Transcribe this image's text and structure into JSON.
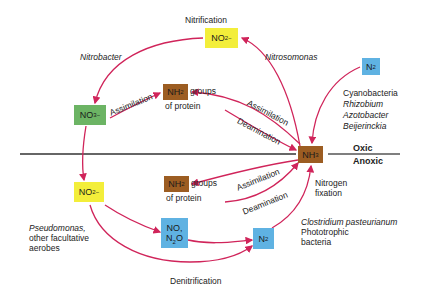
{
  "zones": {
    "oxic": "Oxic",
    "anoxic": "Anoxic"
  },
  "processes": {
    "nitrification": "Nitrification",
    "denitrification": "Denitrification",
    "nitrogen_fixation": [
      "Nitrogen",
      "fixation"
    ],
    "assimilation_upper_left": "Assimilation",
    "assimilation_upper_right": "Assimilation",
    "deamination_upper": "Deamination",
    "assimilation_lower": "Assimilation",
    "deamination_lower": "Deamination"
  },
  "compounds": {
    "no2_top": {
      "base": "NO",
      "sub": "2",
      "sup": "−",
      "color": "#f3ee3a"
    },
    "no3": {
      "base": "NO",
      "sub": "3",
      "sup": "−",
      "color": "#6cb464"
    },
    "nh2_upper": {
      "base": "NH",
      "sub": "2",
      "color": "#9c5d22",
      "suffix": "groups",
      "line2": "of protein"
    },
    "nh3": {
      "base": "NH",
      "sub": "3",
      "color": "#9c5d22"
    },
    "n2_top": {
      "base": "N",
      "sub": "2",
      "color": "#5fb2e2"
    },
    "no2_bottom": {
      "base": "NO",
      "sub": "2",
      "sup": "−",
      "color": "#f3ee3a"
    },
    "nh2_lower": {
      "base": "NH",
      "sub": "2",
      "color": "#9c5d22",
      "suffix": "groups",
      "line2": "of protein"
    },
    "no_n2o": {
      "line1": "NO,",
      "line2_base": "N",
      "line2_sub": "2",
      "line2_rest": "O",
      "color": "#5fb2e2"
    },
    "n2_bottom": {
      "base": "N",
      "sub": "2",
      "color": "#5fb2e2"
    }
  },
  "organisms": {
    "nitrobacter": "Nitrobacter",
    "nitrosomonas": "Nitrosomonas",
    "fixers": [
      "Cyanobacteria",
      "Rhizobium",
      "Azotobacter",
      "Beijerinckia"
    ],
    "denitrifiers": [
      "Pseudomonas,",
      "other facultative",
      "aerobes"
    ],
    "anoxic_fixers": [
      "Clostridium pasteurianum",
      "Phototrophic",
      "bacteria"
    ]
  },
  "colors": {
    "arrow": "#d0245a",
    "line": "#333333"
  }
}
